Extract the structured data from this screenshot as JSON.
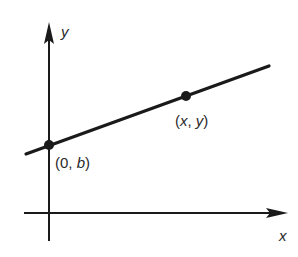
{
  "diagram": {
    "type": "coordinate-plane-line",
    "axes": {
      "x_label": "x",
      "y_label": "y"
    },
    "line": {
      "description": "straight line with positive slope crossing the y-axis"
    },
    "points": [
      {
        "id": "y-intercept",
        "label_open": "(",
        "label_a": "0",
        "label_sep": ", ",
        "label_b": "b",
        "label_close": ")"
      },
      {
        "id": "general-point",
        "label_open": "(",
        "label_a": "x",
        "label_sep": ", ",
        "label_b": "y",
        "label_close": ")"
      }
    ],
    "colors": {
      "ink": "#1a1a1a",
      "background": "#ffffff"
    }
  }
}
